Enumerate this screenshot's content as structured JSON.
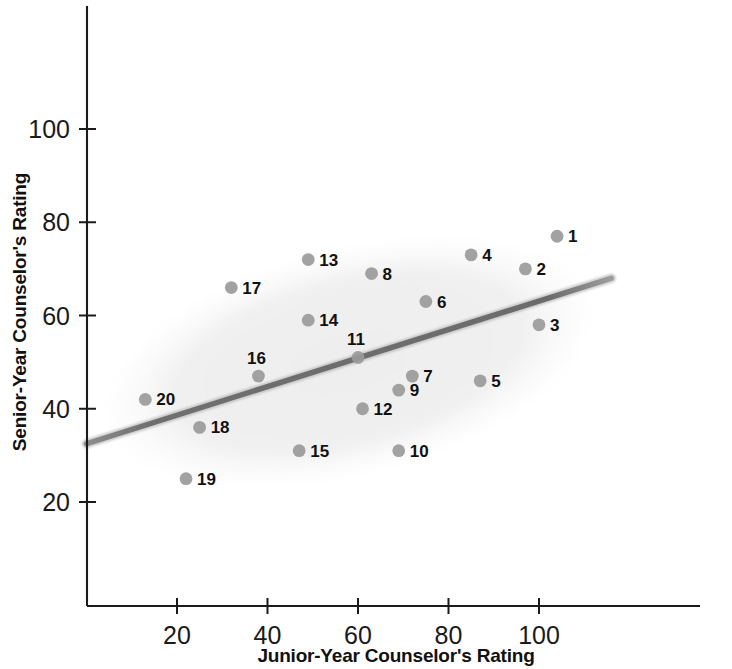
{
  "chart_data": {
    "type": "scatter",
    "title": "",
    "xlabel": "Junior-Year Counselor's Rating",
    "ylabel": "Senior-Year Counselor's Rating",
    "xlim": [
      0,
      120
    ],
    "ylim": [
      10,
      118
    ],
    "xticks": [
      20,
      40,
      60,
      80,
      100
    ],
    "yticks": [
      20,
      40,
      60,
      80,
      100
    ],
    "xtick_labels": [
      "20",
      "40",
      "60",
      "80",
      "100"
    ],
    "ytick_labels": [
      "20",
      "40",
      "60",
      "80",
      "100"
    ],
    "grid": false,
    "legend": "none",
    "point_color": "#9a9a9a",
    "line_color": "#6b6b6b",
    "ellipse_color": "#f1f1f1",
    "points": [
      {
        "label": "1",
        "x": 104,
        "y": 77
      },
      {
        "label": "2",
        "x": 97,
        "y": 70
      },
      {
        "label": "3",
        "x": 100,
        "y": 58
      },
      {
        "label": "4",
        "x": 85,
        "y": 73
      },
      {
        "label": "5",
        "x": 87,
        "y": 46
      },
      {
        "label": "6",
        "x": 75,
        "y": 63
      },
      {
        "label": "7",
        "x": 72,
        "y": 47
      },
      {
        "label": "8",
        "x": 63,
        "y": 69
      },
      {
        "label": "9",
        "x": 69,
        "y": 44
      },
      {
        "label": "10",
        "x": 69,
        "y": 31
      },
      {
        "label": "11",
        "x": 60,
        "y": 51
      },
      {
        "label": "12",
        "x": 61,
        "y": 40
      },
      {
        "label": "13",
        "x": 49,
        "y": 72
      },
      {
        "label": "14",
        "x": 49,
        "y": 59
      },
      {
        "label": "15",
        "x": 47,
        "y": 31
      },
      {
        "label": "16",
        "x": 38,
        "y": 47
      },
      {
        "label": "17",
        "x": 32,
        "y": 66
      },
      {
        "label": "18",
        "x": 25,
        "y": 36
      },
      {
        "label": "19",
        "x": 22,
        "y": 25
      },
      {
        "label": "20",
        "x": 13,
        "y": 42
      }
    ],
    "regression_line": {
      "x1": 0,
      "y1": 32.5,
      "x2": 116,
      "y2": 68
    },
    "ellipse": {
      "cx": 58,
      "cy": 50,
      "rx": 55,
      "ry": 24,
      "rotation_deg": -14
    }
  },
  "axes": {
    "x_title": "Junior-Year Counselor's Rating",
    "y_title": "Senior-Year Counselor's Rating"
  }
}
